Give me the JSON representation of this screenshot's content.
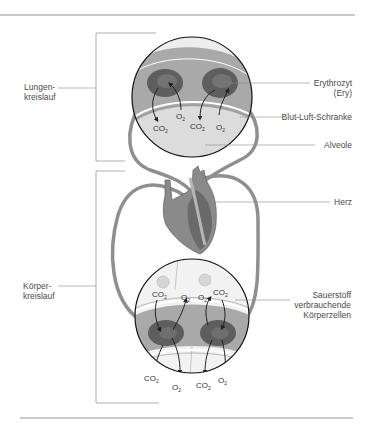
{
  "labels": {
    "lungenkreislauf": [
      "Lungen-",
      "kreislauf"
    ],
    "koerperkreislauf": [
      "Körper-",
      "kreislauf"
    ],
    "erythrozyt": [
      "Erythrozyt",
      "(Ery)"
    ],
    "blut_luft_schranke": "Blut-Luft-Schranke",
    "alveole": "Alveole",
    "herz": "Herz",
    "koerperzellen": [
      "Sauerstoff",
      "verbrauchende",
      "Körperzellen"
    ]
  },
  "molecules": {
    "co2": "CO",
    "o2": "O",
    "sub": "2"
  },
  "colors": {
    "vessel": "#8f8f8f",
    "erythrocyte": "#5e5e5e",
    "erythrocyte_inner": "#737373",
    "plasma": "#a9a9a9",
    "alveole": "#dcdcdc",
    "cell": "#f2f2f2",
    "heart_light": "#8a8a8a",
    "heart_dark": "#6a6a6a",
    "leader_line": "#8c8c8c",
    "rule": "#7a7a7a"
  }
}
